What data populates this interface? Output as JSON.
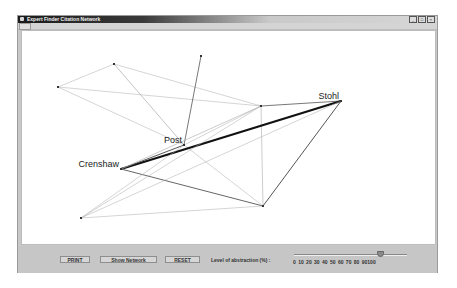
{
  "window": {
    "title": "Expert Finder Citation Network",
    "controls": [
      "_",
      "□",
      "×"
    ]
  },
  "network": {
    "nodes": [
      {
        "id": "A",
        "x": 36,
        "y": 56,
        "label": ""
      },
      {
        "id": "B",
        "x": 92,
        "y": 33,
        "label": ""
      },
      {
        "id": "C",
        "x": 179,
        "y": 25,
        "label": ""
      },
      {
        "id": "Post",
        "x": 162,
        "y": 114,
        "label": "Post"
      },
      {
        "id": "D",
        "x": 239,
        "y": 75,
        "label": ""
      },
      {
        "id": "Stohl",
        "x": 319,
        "y": 70,
        "label": "Stohl"
      },
      {
        "id": "Crenshaw",
        "x": 99,
        "y": 138,
        "label": "Crenshaw"
      },
      {
        "id": "E",
        "x": 241,
        "y": 175,
        "label": ""
      },
      {
        "id": "F",
        "x": 59,
        "y": 187,
        "label": ""
      }
    ],
    "edges": [
      {
        "from": "A",
        "to": "B",
        "weight": 0.5
      },
      {
        "from": "A",
        "to": "D",
        "weight": 0.5
      },
      {
        "from": "A",
        "to": "Post",
        "weight": 0.5
      },
      {
        "from": "B",
        "to": "D",
        "weight": 0.5
      },
      {
        "from": "B",
        "to": "Post",
        "weight": 0.7
      },
      {
        "from": "C",
        "to": "Post",
        "weight": 0.8
      },
      {
        "from": "Post",
        "to": "D",
        "weight": 0.5
      },
      {
        "from": "Post",
        "to": "E",
        "weight": 0.5
      },
      {
        "from": "D",
        "to": "Stohl",
        "weight": 0.8
      },
      {
        "from": "D",
        "to": "E",
        "weight": 0.6
      },
      {
        "from": "Crenshaw",
        "to": "Stohl",
        "weight": 2.2
      },
      {
        "from": "Crenshaw",
        "to": "Post",
        "weight": 1.0
      },
      {
        "from": "Crenshaw",
        "to": "D",
        "weight": 0.6
      },
      {
        "from": "Crenshaw",
        "to": "E",
        "weight": 0.9
      },
      {
        "from": "Stohl",
        "to": "E",
        "weight": 1.0
      },
      {
        "from": "F",
        "to": "Stohl",
        "weight": 0.5
      },
      {
        "from": "F",
        "to": "D",
        "weight": 0.5
      },
      {
        "from": "F",
        "to": "E",
        "weight": 0.5
      },
      {
        "from": "F",
        "to": "Post",
        "weight": 0.5
      }
    ]
  },
  "toolbar": {
    "print_label": "PRINT",
    "show_network_label": "Show Network",
    "reset_label": "RESET",
    "abstraction_label": "Level of abstraction (%) :",
    "slider_value": 90,
    "slider_ticks": "0 10 20 30 40 50 60 70 80 90100"
  }
}
